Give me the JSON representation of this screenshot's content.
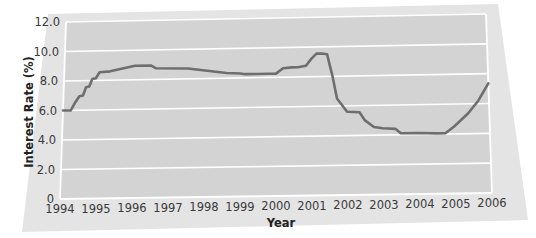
{
  "chart_data": {
    "type": "line",
    "title": "",
    "xlabel": "Year",
    "ylabel": "Interest Rate (%)",
    "xlim": [
      1994,
      2006
    ],
    "ylim": [
      0,
      12
    ],
    "grid": true,
    "legend": false,
    "line_color": "#6e6e6e",
    "plot_bg_color": "#d4d4d4",
    "panel_bg_color": "#e2e2e2",
    "gridline_color": "#ffffff",
    "x_tick_labels": [
      "1994",
      "1995",
      "1996",
      "1997",
      "1998",
      "1999",
      "2000",
      "2001",
      "2002",
      "2003",
      "2004",
      "2005",
      "2006"
    ],
    "x_tick_values": [
      1994,
      1995,
      1996,
      1997,
      1998,
      1999,
      2000,
      2001,
      2002,
      2003,
      2004,
      2005,
      2006
    ],
    "y_tick_labels": [
      "0",
      "2.0",
      "4.0",
      "6.0",
      "8.0",
      "10.0",
      "12.0"
    ],
    "y_tick_values": [
      0,
      2,
      4,
      6,
      8,
      10,
      12
    ],
    "series": [
      {
        "name": "Interest Rate",
        "x": [
          1994.0,
          1994.22,
          1994.34,
          1994.45,
          1994.55,
          1994.63,
          1994.72,
          1994.8,
          1994.9,
          1995.0,
          1995.3,
          1996.0,
          1996.45,
          1996.6,
          1997.5,
          1998.6,
          1999.0,
          1999.12,
          1999.5,
          1999.75,
          2000.0,
          2000.2,
          2000.45,
          2000.62,
          2000.85,
          2001.0,
          2001.15,
          2001.3,
          2001.45,
          2001.6,
          2001.72,
          2002.0,
          2002.35,
          2002.5,
          2002.75,
          2003.0,
          2003.35,
          2003.5,
          2004.0,
          2004.5,
          2004.75,
          2005.0,
          2005.4,
          2005.7,
          2006.0
        ],
        "y": [
          6.0,
          6.0,
          6.55,
          6.95,
          7.0,
          7.55,
          7.6,
          8.1,
          8.15,
          8.55,
          8.6,
          8.95,
          8.95,
          8.75,
          8.7,
          8.35,
          8.3,
          8.25,
          8.25,
          8.25,
          8.25,
          8.6,
          8.65,
          8.65,
          8.75,
          9.2,
          9.55,
          9.55,
          9.5,
          8.0,
          6.5,
          5.6,
          5.55,
          5.0,
          4.55,
          4.45,
          4.4,
          4.1,
          4.1,
          4.05,
          4.05,
          4.5,
          5.35,
          6.2,
          7.35
        ]
      }
    ]
  }
}
